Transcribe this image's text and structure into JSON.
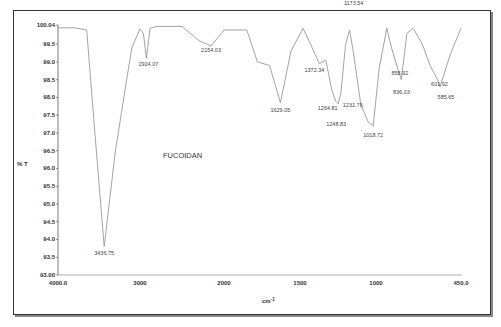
{
  "chart_data": {
    "type": "line",
    "title": "FUCOIDAN",
    "xlabel": "cm-1",
    "ylabel": "% T",
    "xlim": [
      4000.0,
      450.0
    ],
    "ylim": [
      93.0,
      100.04
    ],
    "grid": false,
    "legend": null,
    "x_ticks": [
      "4000.0",
      "3000",
      "2000",
      "1500",
      "1000",
      "450.0"
    ],
    "y_ticks": [
      "100.04",
      "99.5",
      "99.0",
      "98.5",
      "98.0",
      "97.5",
      "97.0",
      "96.5",
      "96.0",
      "95.5",
      "95.0",
      "94.5",
      "94.0",
      "93.5",
      "93.00"
    ],
    "series": [
      {
        "name": "FUCOIDAN",
        "x": [
          4000,
          3800,
          3650,
          3550,
          3436.75,
          3300,
          3100,
          3000,
          2960,
          2924.07,
          2880,
          2800,
          2500,
          2300,
          2154.03,
          2000,
          1850,
          1780,
          1700,
          1629.05,
          1560,
          1480,
          1420,
          1372.34,
          1330,
          1290,
          1264.81,
          1248.83,
          1231.76,
          1200,
          1173.54,
          1150,
          1100,
          1050,
          1018.72,
          980,
          930,
          900,
          858.92,
          836.03,
          800,
          760,
          700,
          650,
          601.92,
          585.65,
          520,
          450
        ],
        "y": [
          99.96,
          99.96,
          99.9,
          97.0,
          93.8,
          96.5,
          99.4,
          99.93,
          99.8,
          99.1,
          99.95,
          100.0,
          100.0,
          99.6,
          99.45,
          99.9,
          99.9,
          99.0,
          98.9,
          97.85,
          99.3,
          99.95,
          99.4,
          98.95,
          99.05,
          98.2,
          97.9,
          97.82,
          98.1,
          99.5,
          99.9,
          99.3,
          97.8,
          97.3,
          97.2,
          98.8,
          99.95,
          99.4,
          98.8,
          98.5,
          99.8,
          99.95,
          99.5,
          98.9,
          98.5,
          98.3,
          99.2,
          99.95
        ]
      }
    ],
    "annotations": [
      {
        "label": "3436.75",
        "x": 3436.75,
        "y": 93.8
      },
      {
        "label": "2924.07",
        "x": 2924.07,
        "y": 99.1
      },
      {
        "label": "2154.03",
        "x": 2154.03,
        "y": 99.45
      },
      {
        "label": "1629.05",
        "x": 1629.05,
        "y": 97.85
      },
      {
        "label": "1372.34",
        "x": 1372.34,
        "y": 98.95
      },
      {
        "label": "1264.81",
        "x": 1264.81,
        "y": 97.9
      },
      {
        "label": "1248.83",
        "x": 1248.83,
        "y": 97.82
      },
      {
        "label": "1231.76",
        "x": 1231.76,
        "y": 98.1
      },
      {
        "label": "1173.54",
        "x": 1173.54,
        "y": 99.9
      },
      {
        "label": "1018.72",
        "x": 1018.72,
        "y": 97.2
      },
      {
        "label": "858.92",
        "x": 858.92,
        "y": 98.8
      },
      {
        "label": "836.03",
        "x": 836.03,
        "y": 98.5
      },
      {
        "label": "601.92",
        "x": 601.92,
        "y": 98.5
      },
      {
        "label": "585.65",
        "x": 585.65,
        "y": 98.3
      }
    ]
  }
}
